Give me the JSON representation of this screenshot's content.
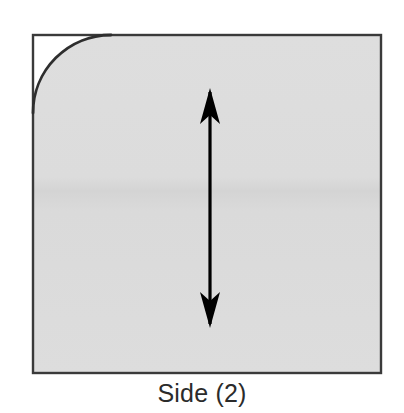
{
  "figure": {
    "caption": "Side (2)",
    "shape": {
      "name": "rounded-corner-square",
      "fill_color": "#dcdcdc",
      "stroke_color": "#3a3a3a",
      "stroke_width": 2,
      "left": 33,
      "top": 35,
      "right": 381,
      "bottom": 373,
      "width": 348,
      "height": 338,
      "corner_radius": 78,
      "rounded_corner": "top-left",
      "outside_corner_fill": "#ffffff"
    },
    "annotation": {
      "name": "double-headed-vertical-arrow",
      "type": "double-arrow",
      "orientation": "vertical",
      "color": "#000000",
      "x_center": 210,
      "y_top": 88,
      "y_bottom": 328,
      "length": 240,
      "shaft_width": 3,
      "head_width": 20,
      "head_length": 34
    },
    "background_color": "#ffffff",
    "tone_band": {
      "name": "scan-tone-band",
      "y": 182,
      "color": "#d6d6d6"
    }
  }
}
